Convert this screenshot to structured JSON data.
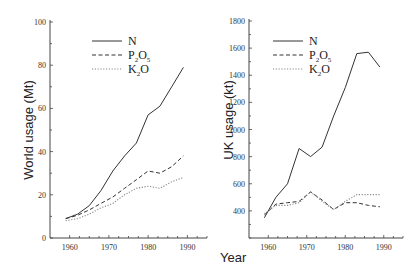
{
  "chart_data": [
    {
      "type": "line",
      "title": "",
      "xlabel": "",
      "ylabel": "World usage (Mt)",
      "xlim": [
        1955,
        1995
      ],
      "ylim": [
        0,
        100
      ],
      "xticks": [
        1960,
        1970,
        1980,
        1990
      ],
      "yticks": [
        0,
        20,
        40,
        60,
        80,
        100
      ],
      "grid": false,
      "legend_position": "upper-left-center",
      "series": [
        {
          "name": "N",
          "style": "solid",
          "x": [
            1959,
            1962,
            1965,
            1968,
            1971,
            1974,
            1977,
            1980,
            1983,
            1986,
            1989
          ],
          "values": [
            9,
            11,
            15,
            22,
            31,
            38,
            44,
            57,
            61,
            70,
            79
          ]
        },
        {
          "name": "P2O5",
          "style": "dashed",
          "x": [
            1959,
            1962,
            1965,
            1968,
            1971,
            1974,
            1977,
            1980,
            1983,
            1986,
            1989
          ],
          "values": [
            9,
            10.5,
            13,
            16,
            19,
            23,
            27,
            31,
            30,
            33,
            38
          ]
        },
        {
          "name": "K2O",
          "style": "dotted",
          "x": [
            1959,
            1962,
            1965,
            1968,
            1971,
            1974,
            1977,
            1980,
            1983,
            1986,
            1989
          ],
          "values": [
            8,
            9,
            11,
            14,
            16,
            20,
            23,
            24,
            23,
            26,
            28
          ]
        }
      ]
    },
    {
      "type": "line",
      "title": "",
      "xlabel": "Year",
      "ylabel": "UK usage (kt)",
      "xlim": [
        1955,
        1995
      ],
      "ylim": [
        200,
        1800
      ],
      "xticks": [
        1960,
        1970,
        1980,
        1990
      ],
      "yticks": [
        400,
        600,
        800,
        1000,
        1200,
        1400,
        1600,
        1800
      ],
      "grid": false,
      "legend_position": "upper-left-center",
      "series": [
        {
          "name": "N",
          "style": "solid",
          "x": [
            1959,
            1962,
            1965,
            1968,
            1971,
            1974,
            1977,
            1980,
            1983,
            1986,
            1989
          ],
          "values": [
            350,
            500,
            600,
            860,
            800,
            870,
            1100,
            1310,
            1560,
            1570,
            1460
          ]
        },
        {
          "name": "P2O5",
          "style": "dashed",
          "x": [
            1959,
            1962,
            1965,
            1968,
            1971,
            1974,
            1977,
            1980,
            1983,
            1986,
            1989
          ],
          "values": [
            370,
            450,
            460,
            470,
            540,
            480,
            410,
            460,
            460,
            440,
            430
          ]
        },
        {
          "name": "K2O",
          "style": "dotted",
          "x": [
            1959,
            1962,
            1965,
            1968,
            1971,
            1974,
            1977,
            1980,
            1983,
            1986,
            1989
          ],
          "values": [
            380,
            440,
            440,
            460,
            540,
            470,
            410,
            470,
            520,
            520,
            520
          ]
        }
      ]
    }
  ],
  "labels": {
    "left_ylabel": "World usage (Mt)",
    "right_ylabel": "UK usage (kt)",
    "xlabel": "Year",
    "legend": [
      {
        "main": "N",
        "parts": []
      },
      {
        "main": "P",
        "parts": [
          "2",
          "O",
          "5"
        ]
      },
      {
        "main": "K",
        "parts": [
          "2",
          "O"
        ]
      }
    ]
  },
  "colors": {
    "line": "#333333",
    "axis": "#444444",
    "dotted": "#888888"
  }
}
